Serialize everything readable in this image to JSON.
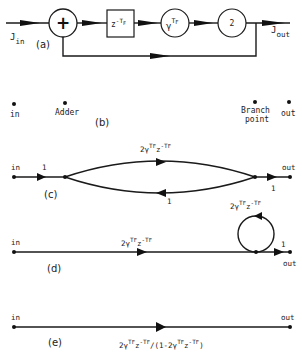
{
  "figure": {
    "panels": {
      "a": {
        "label": "(a)",
        "input_label": "J",
        "input_sub": "in",
        "output_label": "J",
        "output_sub": "out",
        "adder_symbol": "+",
        "delay_block": {
          "base": "z",
          "exp": "-T",
          "exp_sub": "F"
        },
        "gain_block": {
          "base": "γ",
          "exp": "T",
          "exp_sub": "F"
        },
        "multiplier_block": "2"
      },
      "b": {
        "label": "(b)",
        "nodes": [
          "in",
          "Adder",
          "Branch",
          "point",
          "out"
        ]
      },
      "c": {
        "label": "(c)",
        "in_label": "in",
        "out_label": "out",
        "input_branch_gain": "1",
        "output_branch_gain": "1",
        "forward_gain": {
          "coef": "2γ",
          "exp1": "T",
          "exp1_sub": "F",
          "mid": "z",
          "exp2": "-T",
          "exp2_sub": "F"
        },
        "feedback_gain": "1"
      },
      "d": {
        "label": "(d)",
        "in_label": "in",
        "out_label": "out",
        "forward_gain": {
          "coef": "2γ",
          "exp1": "T",
          "exp1_sub": "F",
          "mid": "z",
          "exp2": "-T",
          "exp2_sub": "F"
        },
        "self_loop_gain": {
          "coef": "2γ",
          "exp1": "T",
          "exp1_sub": "F",
          "mid": "z",
          "exp2": "-T",
          "exp2_sub": "F"
        },
        "output_branch_gain": "1"
      },
      "e": {
        "label": "(e)",
        "in_label": "in",
        "out_label": "out",
        "transfer_function": "2γ^{T_F} z^{-T_F} / (1 - 2γ^{T_F} z^{-T_F})",
        "tf_parts": {
          "coef": "2γ",
          "exp1": "T",
          "exp1_sub": "F",
          "mid": "z",
          "exp2": "-T",
          "exp2_sub": "F",
          "div": "/(1-2γ",
          "close": ")"
        }
      }
    }
  }
}
